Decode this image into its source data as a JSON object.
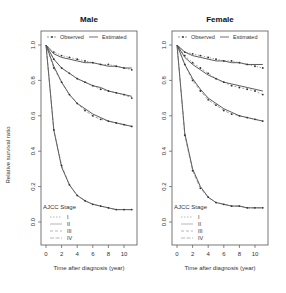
{
  "figure": {
    "ylabel": "Relative survival ratio",
    "xlabel": "Time after diagnosis (year)",
    "legend_top": {
      "observed": "Observed",
      "estimated": "Estimated"
    },
    "legend_stage": {
      "title": "AJCC Stage",
      "items": [
        "I",
        "II",
        "III",
        "IV"
      ]
    },
    "x_ticks": [
      "0",
      "2",
      "4",
      "6",
      "8",
      "10"
    ],
    "y_ticks": [
      "0.0",
      "0.2",
      "0.4",
      "0.6",
      "0.8",
      "1.0"
    ]
  },
  "panels": [
    {
      "title": "Male"
    },
    {
      "title": "Female"
    }
  ],
  "chart_data": [
    {
      "type": "line",
      "title": "Male",
      "xlabel": "Time after diagnosis (year)",
      "ylabel": "Relative survival ratio",
      "xlim": [
        0,
        11
      ],
      "ylim": [
        0,
        1.0
      ],
      "x_ticks": [
        0,
        2,
        4,
        6,
        8,
        10
      ],
      "y_ticks": [
        0.0,
        0.2,
        0.4,
        0.6,
        0.8,
        1.0
      ],
      "legend": [
        "Observed",
        "Estimated",
        "AJCC Stage I",
        "AJCC Stage II",
        "AJCC Stage III",
        "AJCC Stage IV"
      ],
      "x": [
        0,
        1,
        2,
        3,
        4,
        5,
        6,
        7,
        8,
        9,
        10,
        11
      ],
      "series": [
        {
          "name": "Stage I observed",
          "values": [
            1.0,
            0.96,
            0.94,
            0.93,
            0.92,
            0.91,
            0.9,
            0.89,
            0.89,
            0.88,
            0.87,
            0.86
          ]
        },
        {
          "name": "Stage I estimated",
          "values": [
            1.0,
            0.95,
            0.93,
            0.92,
            0.91,
            0.9,
            0.9,
            0.89,
            0.88,
            0.88,
            0.87,
            0.87
          ]
        },
        {
          "name": "Stage II observed",
          "values": [
            1.0,
            0.92,
            0.87,
            0.84,
            0.81,
            0.79,
            0.77,
            0.75,
            0.74,
            0.73,
            0.72,
            0.7
          ]
        },
        {
          "name": "Stage II estimated",
          "values": [
            1.0,
            0.92,
            0.87,
            0.84,
            0.81,
            0.79,
            0.77,
            0.76,
            0.74,
            0.73,
            0.72,
            0.71
          ]
        },
        {
          "name": "Stage III observed",
          "values": [
            1.0,
            0.87,
            0.79,
            0.72,
            0.67,
            0.63,
            0.6,
            0.58,
            0.57,
            0.56,
            0.55,
            0.54
          ]
        },
        {
          "name": "Stage III estimated",
          "values": [
            1.0,
            0.88,
            0.79,
            0.72,
            0.67,
            0.64,
            0.61,
            0.59,
            0.57,
            0.56,
            0.55,
            0.54
          ]
        },
        {
          "name": "Stage IV observed",
          "values": [
            1.0,
            0.52,
            0.32,
            0.21,
            0.15,
            0.12,
            0.1,
            0.09,
            0.08,
            0.07,
            0.07,
            0.07
          ]
        },
        {
          "name": "Stage IV estimated",
          "values": [
            1.0,
            0.52,
            0.31,
            0.21,
            0.15,
            0.12,
            0.1,
            0.09,
            0.08,
            0.07,
            0.07,
            0.07
          ]
        }
      ]
    },
    {
      "type": "line",
      "title": "Female",
      "xlabel": "Time after diagnosis (year)",
      "ylabel": "Relative survival ratio",
      "xlim": [
        0,
        11
      ],
      "ylim": [
        0,
        1.0
      ],
      "x_ticks": [
        0,
        2,
        4,
        6,
        8,
        10
      ],
      "y_ticks": [
        0.0,
        0.2,
        0.4,
        0.6,
        0.8,
        1.0
      ],
      "legend": [
        "Observed",
        "Estimated",
        "AJCC Stage I",
        "AJCC Stage II",
        "AJCC Stage III",
        "AJCC Stage IV"
      ],
      "x": [
        0,
        1,
        2,
        3,
        4,
        5,
        6,
        7,
        8,
        9,
        10,
        11
      ],
      "series": [
        {
          "name": "Stage I observed",
          "values": [
            1.0,
            0.96,
            0.95,
            0.94,
            0.93,
            0.92,
            0.91,
            0.91,
            0.9,
            0.89,
            0.88,
            0.87
          ]
        },
        {
          "name": "Stage I estimated",
          "values": [
            1.0,
            0.96,
            0.94,
            0.93,
            0.92,
            0.91,
            0.91,
            0.9,
            0.9,
            0.89,
            0.89,
            0.89
          ]
        },
        {
          "name": "Stage II observed",
          "values": [
            1.0,
            0.94,
            0.9,
            0.87,
            0.84,
            0.81,
            0.79,
            0.77,
            0.76,
            0.75,
            0.74,
            0.72
          ]
        },
        {
          "name": "Stage II estimated",
          "values": [
            1.0,
            0.93,
            0.89,
            0.86,
            0.83,
            0.81,
            0.79,
            0.78,
            0.77,
            0.76,
            0.75,
            0.74
          ]
        },
        {
          "name": "Stage III observed",
          "values": [
            1.0,
            0.89,
            0.8,
            0.74,
            0.69,
            0.66,
            0.63,
            0.61,
            0.6,
            0.59,
            0.58,
            0.57
          ]
        },
        {
          "name": "Stage III estimated",
          "values": [
            1.0,
            0.89,
            0.81,
            0.75,
            0.7,
            0.67,
            0.64,
            0.62,
            0.6,
            0.59,
            0.58,
            0.57
          ]
        },
        {
          "name": "Stage IV observed",
          "values": [
            1.0,
            0.49,
            0.29,
            0.19,
            0.14,
            0.11,
            0.1,
            0.09,
            0.09,
            0.08,
            0.08,
            0.08
          ]
        },
        {
          "name": "Stage IV estimated",
          "values": [
            1.0,
            0.5,
            0.3,
            0.2,
            0.14,
            0.11,
            0.1,
            0.09,
            0.09,
            0.08,
            0.08,
            0.08
          ]
        }
      ]
    }
  ]
}
